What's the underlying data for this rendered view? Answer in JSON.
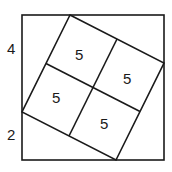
{
  "diagram": {
    "side_labels": {
      "upper_left_segment": "4",
      "lower_left_segment": "2"
    },
    "inner_square_labels": [
      "5",
      "5",
      "5",
      "5"
    ],
    "stroke_color": "#1a1a1a",
    "background": "#ffffff"
  }
}
